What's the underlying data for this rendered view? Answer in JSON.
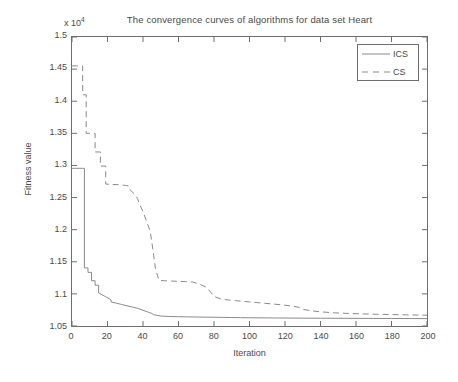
{
  "chart_data": {
    "type": "line",
    "title": "The convergence curves of algorithms for data set Heart",
    "xlabel": "Iteration",
    "ylabel": "Fitness value",
    "y_multiplier": "x 10",
    "y_multiplier_exponent": "4",
    "xlim": [
      0,
      200
    ],
    "ylim": [
      10500,
      15000
    ],
    "ylim_scaled": [
      1.05,
      1.5
    ],
    "xticks": [
      0,
      20,
      40,
      60,
      80,
      100,
      120,
      140,
      160,
      180,
      200
    ],
    "xtick_labels": [
      "0",
      "20",
      "40",
      "60",
      "80",
      "100",
      "120",
      "140",
      "160",
      "180",
      "200"
    ],
    "yticks": [
      1.05,
      1.1,
      1.15,
      1.2,
      1.25,
      1.3,
      1.35,
      1.4,
      1.45,
      1.5
    ],
    "ytick_labels": [
      "1.05",
      "1.1",
      "1.15",
      "1.2",
      "1.25",
      "1.3",
      "1.35",
      "1.4",
      "1.45",
      "1.5"
    ],
    "grid": false,
    "legend_position": "top-right",
    "series": [
      {
        "name": "ICS",
        "style": "solid",
        "color": "#8a8a8a",
        "x": [
          0,
          2,
          4,
          6,
          7,
          7,
          9,
          9,
          11,
          11,
          13,
          13,
          15,
          15,
          17,
          19,
          21,
          22,
          22,
          25,
          28,
          31,
          34,
          37,
          40,
          43,
          45,
          46,
          48,
          50,
          55,
          60,
          65,
          70,
          75,
          80,
          85,
          90,
          95,
          100,
          110,
          120,
          130,
          140,
          150,
          160,
          170,
          180,
          190,
          200
        ],
        "y": [
          1.2955,
          1.2955,
          1.2955,
          1.2955,
          1.2955,
          1.1405,
          1.1405,
          1.1335,
          1.1335,
          1.1205,
          1.1205,
          1.1135,
          1.1135,
          1.1015,
          1.0985,
          1.0955,
          1.0925,
          1.0905,
          1.0875,
          1.0855,
          1.0835,
          1.0815,
          1.0795,
          1.0775,
          1.0745,
          1.0715,
          1.0695,
          1.0675,
          1.0665,
          1.0655,
          1.0648,
          1.0645,
          1.0642,
          1.064,
          1.0638,
          1.0636,
          1.0634,
          1.0632,
          1.063,
          1.0628,
          1.0626,
          1.0624,
          1.0622,
          1.0621,
          1.062,
          1.0619,
          1.0618,
          1.0617,
          1.0616,
          1.0615
        ]
      },
      {
        "name": "CS",
        "style": "dashed",
        "color": "#8a8a8a",
        "x": [
          0,
          3,
          5,
          6,
          6,
          8,
          8,
          11,
          13,
          13,
          16,
          16,
          19,
          19,
          22,
          26,
          30,
          32,
          32,
          35,
          37,
          38,
          40,
          42,
          44,
          45,
          46,
          47,
          49,
          52,
          56,
          60,
          64,
          68,
          72,
          76,
          78,
          80,
          84,
          88,
          92,
          96,
          100,
          106,
          112,
          118,
          124,
          128,
          130,
          134,
          140,
          148,
          156,
          164,
          172,
          180,
          188,
          196,
          200
        ],
        "y": [
          1.455,
          1.455,
          1.455,
          1.455,
          1.41,
          1.41,
          1.35,
          1.35,
          1.35,
          1.321,
          1.321,
          1.299,
          1.299,
          1.271,
          1.2705,
          1.27,
          1.269,
          1.268,
          1.264,
          1.256,
          1.248,
          1.24,
          1.228,
          1.213,
          1.198,
          1.18,
          1.16,
          1.14,
          1.121,
          1.1205,
          1.12,
          1.1195,
          1.119,
          1.1185,
          1.115,
          1.11,
          1.103,
          1.096,
          1.092,
          1.0905,
          1.0895,
          1.0885,
          1.0875,
          1.086,
          1.0845,
          1.083,
          1.081,
          1.079,
          1.076,
          1.074,
          1.072,
          1.0705,
          1.0695,
          1.0688,
          1.0682,
          1.0678,
          1.0674,
          1.067,
          1.0668
        ]
      }
    ]
  },
  "legend": {
    "items": [
      {
        "label": "ICS",
        "style": "solid"
      },
      {
        "label": "CS",
        "style": "dashed"
      }
    ]
  }
}
